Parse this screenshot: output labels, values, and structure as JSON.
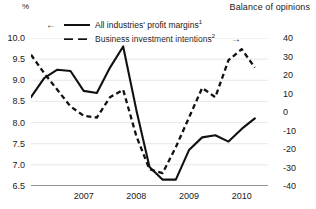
{
  "axes": {
    "left_unit_label": "%",
    "right_axis_title": "Balance of opinions",
    "left_ticks": [
      "10.0",
      "9.5",
      "9.0",
      "8.5",
      "8.0",
      "7.5",
      "7.0",
      "6.5"
    ],
    "right_ticks": [
      "40",
      "30",
      "20",
      "10",
      "0",
      "-10",
      "-20",
      "-30",
      "-40"
    ],
    "x_ticks": [
      "2007",
      "2008",
      "2009",
      "2010"
    ]
  },
  "legend": {
    "left_arrow": "←",
    "right_arrow": "→",
    "items": [
      {
        "label": "All industries' profit margins",
        "footnote": "1",
        "style": "solid",
        "axis": "left"
      },
      {
        "label": "Business investment intentions",
        "footnote": "2",
        "style": "dashed",
        "axis": "right"
      }
    ]
  },
  "chart_data": {
    "type": "line",
    "title": "",
    "xlabel": "",
    "ylabel": "%",
    "y2label": "Balance of opinions",
    "grid": true,
    "legend_position": "top-left",
    "xlim": [
      2006.5,
      2011.0
    ],
    "ylim": [
      6.5,
      10.0
    ],
    "y2lim": [
      -40,
      40
    ],
    "x_tick_labels": [
      "2007",
      "2008",
      "2009",
      "2010"
    ],
    "x_tick_positions": [
      2007.0,
      2008.0,
      2009.0,
      2010.0
    ],
    "x_minor_tick_step": 0.25,
    "series": [
      {
        "name": "All industries' profit margins",
        "footnote": "1",
        "axis": "left",
        "style": "solid",
        "unit": "%",
        "x": [
          2006.5,
          2006.75,
          2007.0,
          2007.25,
          2007.5,
          2007.75,
          2008.0,
          2008.25,
          2008.5,
          2008.75,
          2009.0,
          2009.25,
          2009.5,
          2009.75,
          2010.0,
          2010.25,
          2010.5,
          2010.75
        ],
        "values": [
          8.6,
          9.05,
          9.25,
          9.22,
          8.75,
          8.7,
          9.3,
          9.8,
          8.3,
          6.95,
          6.65,
          6.65,
          7.35,
          7.65,
          7.7,
          7.55,
          7.85,
          8.1
        ]
      },
      {
        "name": "Business investment intentions",
        "footnote": "2",
        "axis": "right",
        "style": "dashed",
        "unit": "balance",
        "x": [
          2006.5,
          2006.75,
          2007.0,
          2007.25,
          2007.5,
          2007.75,
          2008.0,
          2008.25,
          2008.5,
          2008.75,
          2009.0,
          2009.25,
          2009.5,
          2009.75,
          2010.0,
          2010.25,
          2010.5,
          2010.75
        ],
        "values": [
          31,
          21,
          12,
          3,
          -2,
          -3,
          8,
          12,
          -13,
          -31,
          -33,
          -19,
          -3,
          13,
          8,
          28,
          34,
          24
        ]
      }
    ]
  }
}
